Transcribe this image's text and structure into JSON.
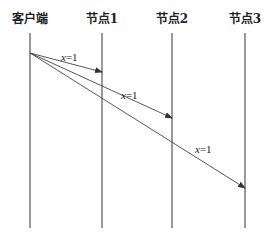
{
  "diagram": {
    "type": "sequence",
    "participants": [
      {
        "id": "client",
        "label": "客户端",
        "x": 30
      },
      {
        "id": "node1",
        "label": "节点1",
        "x": 102
      },
      {
        "id": "node2",
        "label": "节点2",
        "x": 172
      },
      {
        "id": "node3",
        "label": "节点3",
        "x": 245
      }
    ],
    "messages": [
      {
        "from": "client",
        "to": "node1",
        "var": "x",
        "eq": "=1",
        "label": "x=1",
        "y_start": 53,
        "y_end": 72
      },
      {
        "from": "client",
        "to": "node2",
        "var": "x",
        "eq": "=1",
        "label": "x=1",
        "y_start": 53,
        "y_end": 118
      },
      {
        "from": "client",
        "to": "node3",
        "var": "x",
        "eq": "=1",
        "label": "x=1",
        "y_start": 53,
        "y_end": 188
      }
    ],
    "colors": {
      "line": "#555555",
      "text": "#222222"
    }
  }
}
